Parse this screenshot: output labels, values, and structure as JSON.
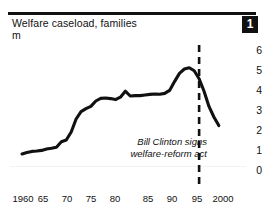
{
  "figure": {
    "badge_number": "1",
    "title": "Welfare caseload, families",
    "unit": "m",
    "rule_color": "#111111",
    "line_color": "#111111",
    "background": "#ffffff"
  },
  "annotation": {
    "line1": "Bill Clinton signs",
    "line2": "welfare-reform act",
    "marker_year": 1996
  },
  "chart_data": {
    "type": "line",
    "title": "Welfare caseload, families",
    "subtitle": "m",
    "xlabel": "",
    "ylabel": "m",
    "xlim": [
      1958,
      2001
    ],
    "ylim": [
      0,
      6.4
    ],
    "grid": false,
    "legend": null,
    "y_axis_position": "right",
    "yticks": [
      6,
      5,
      4,
      3,
      2,
      1,
      0
    ],
    "ytick_labels": [
      "6",
      "5",
      "4",
      "3",
      "2",
      "1",
      "0"
    ],
    "xticks": [
      1960,
      1965,
      1970,
      1975,
      1980,
      1985,
      1990,
      1995,
      2000
    ],
    "xtick_labels": [
      "1960",
      "65",
      "70",
      "75",
      "80",
      "85",
      "90",
      "95",
      "2000"
    ],
    "annotations": [
      {
        "text": "Bill Clinton signs welfare-reform act",
        "x": 1996,
        "style": "dashed-vertical-line"
      }
    ],
    "series": [
      {
        "name": "Welfare caseload, families (m)",
        "x": [
          1960,
          1961,
          1962,
          1963,
          1964,
          1965,
          1966,
          1967,
          1968,
          1969,
          1970,
          1971,
          1972,
          1973,
          1974,
          1975,
          1976,
          1977,
          1978,
          1979,
          1980,
          1981,
          1982,
          1983,
          1984,
          1985,
          1986,
          1987,
          1988,
          1989,
          1990,
          1991,
          1992,
          1993,
          1994,
          1995,
          1996,
          1997,
          1998,
          1999,
          2000
        ],
        "values": [
          0.8,
          0.87,
          0.93,
          0.95,
          0.98,
          1.05,
          1.09,
          1.14,
          1.41,
          1.5,
          1.9,
          2.55,
          2.92,
          3.07,
          3.18,
          3.45,
          3.58,
          3.6,
          3.57,
          3.52,
          3.64,
          3.94,
          3.7,
          3.72,
          3.72,
          3.75,
          3.78,
          3.8,
          3.79,
          3.83,
          3.98,
          4.42,
          4.83,
          5.05,
          5.11,
          4.96,
          4.56,
          3.94,
          3.18,
          2.65,
          2.22
        ]
      }
    ]
  }
}
